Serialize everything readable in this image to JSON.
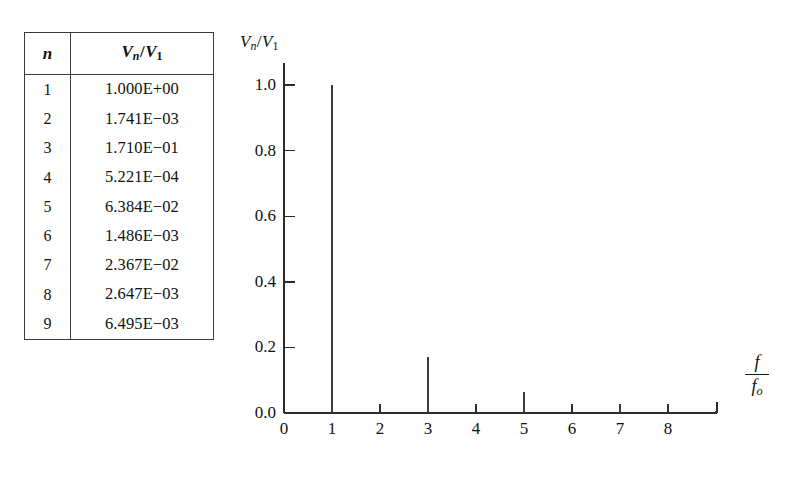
{
  "table": {
    "headers": [
      "n",
      "Vn/V1"
    ],
    "header_parts": {
      "col1": "n",
      "col2_base": "V",
      "col2_sub": "n",
      "col2_slash": "/",
      "col2_base2": "V",
      "col2_sub2": "1"
    },
    "rows": [
      {
        "n": "1",
        "ratio": "1.000E+00"
      },
      {
        "n": "2",
        "ratio": "1.741E−03"
      },
      {
        "n": "3",
        "ratio": "1.710E−01"
      },
      {
        "n": "4",
        "ratio": "5.221E−04"
      },
      {
        "n": "5",
        "ratio": "6.384E−02"
      },
      {
        "n": "6",
        "ratio": "1.486E−03"
      },
      {
        "n": "7",
        "ratio": "2.367E−02"
      },
      {
        "n": "8",
        "ratio": "2.647E−03"
      },
      {
        "n": "9",
        "ratio": "6.495E−03"
      }
    ]
  },
  "chart_axis": {
    "y_title_base": "V",
    "y_title_sub": "n",
    "y_title_slash": "/",
    "y_title_base2": "V",
    "y_title_sub2": "1",
    "x_title_num": "f",
    "x_title_den_base": "f",
    "x_title_den_sub": "o",
    "y_ticks": [
      "0.0",
      "0.2",
      "0.4",
      "0.6",
      "0.8",
      "1.0"
    ],
    "x_ticks": [
      "0",
      "1",
      "2",
      "3",
      "4",
      "5",
      "6",
      "7",
      "8"
    ]
  },
  "chart_data": {
    "type": "bar",
    "title": "",
    "subtitle": "",
    "xlabel": "f/f_o",
    "ylabel": "V_n/V_1",
    "xlim": [
      0,
      9.2
    ],
    "ylim": [
      0.0,
      1.05
    ],
    "grid": false,
    "legend": false,
    "x": [
      1,
      2,
      3,
      4,
      5,
      6,
      7,
      8,
      9
    ],
    "values": [
      1.0,
      0.001741,
      0.171,
      0.0005221,
      0.06384,
      0.001486,
      0.02367,
      0.002647,
      0.006495
    ],
    "categories": [
      "1",
      "2",
      "3",
      "4",
      "5",
      "6",
      "7",
      "8",
      "9"
    ],
    "y_tick_values": [
      0.0,
      0.2,
      0.4,
      0.6,
      0.8,
      1.0
    ],
    "x_tick_values": [
      0,
      1,
      2,
      3,
      4,
      5,
      6,
      7,
      8
    ]
  }
}
